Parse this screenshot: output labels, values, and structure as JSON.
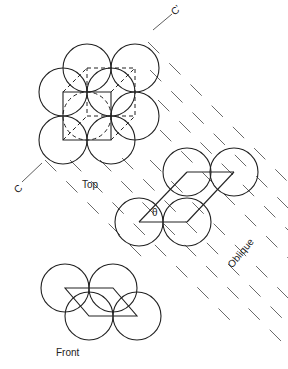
{
  "labels": {
    "top": "Top",
    "oblique": "Oblique",
    "front": "Front",
    "theta": "θ",
    "c": "C",
    "c_prime": "C'"
  },
  "radius": 24,
  "top_view": {
    "solid_circles": [
      [
        63,
        92
      ],
      [
        111,
        92
      ],
      [
        63,
        140
      ],
      [
        111,
        140
      ],
      [
        87,
        68
      ],
      [
        135,
        68
      ],
      [
        135,
        116
      ]
    ],
    "dashed_circles": [
      [
        87,
        116
      ]
    ],
    "solid_square": [
      [
        63,
        92
      ],
      [
        111,
        92
      ],
      [
        111,
        140
      ],
      [
        63,
        140
      ]
    ],
    "dashed_square": [
      [
        87,
        68
      ],
      [
        135,
        68
      ],
      [
        135,
        116
      ],
      [
        87,
        116
      ]
    ],
    "diagonals_dashed": [
      [
        [
          63,
          92
        ],
        [
          87,
          68
        ]
      ],
      [
        [
          111,
          92
        ],
        [
          135,
          68
        ]
      ],
      [
        [
          111,
          140
        ],
        [
          135,
          116
        ]
      ],
      [
        [
          63,
          140
        ],
        [
          87,
          116
        ]
      ]
    ]
  },
  "oblique_view": {
    "circles": [
      [
        187,
        172
      ],
      [
        234,
        172
      ],
      [
        139,
        222
      ],
      [
        187,
        222
      ]
    ],
    "edges": [
      [
        [
          139,
          222
        ],
        [
          187,
          222
        ]
      ],
      [
        [
          139,
          222
        ],
        [
          187,
          172
        ]
      ],
      [
        [
          187,
          222
        ],
        [
          234,
          172
        ]
      ],
      [
        [
          187,
          172
        ],
        [
          234,
          172
        ]
      ]
    ]
  },
  "front_view": {
    "solid_circles": [
      [
        65,
        288
      ],
      [
        113,
        288
      ],
      [
        89,
        316
      ],
      [
        137,
        316
      ]
    ],
    "parallelogram": [
      [
        65,
        288
      ],
      [
        113,
        288
      ],
      [
        137,
        316
      ],
      [
        89,
        316
      ]
    ]
  },
  "axis_line": {
    "segments": [
      [
        [
          22,
          182
        ],
        [
          42,
          163
        ]
      ],
      [
        [
          153,
          30
        ],
        [
          172,
          14
        ]
      ]
    ]
  },
  "projection_lines": [
    [
      [
        100,
        160
      ],
      [
        300,
        360
      ]
    ],
    [
      [
        122,
        158
      ],
      [
        300,
        336
      ]
    ],
    [
      [
        150,
        160
      ],
      [
        300,
        310
      ]
    ],
    [
      [
        160,
        130
      ],
      [
        300,
        270
      ]
    ],
    [
      [
        158,
        100
      ],
      [
        300,
        242
      ]
    ],
    [
      [
        150,
        70
      ],
      [
        300,
        220
      ]
    ],
    [
      [
        70,
        160
      ],
      [
        230,
        320
      ]
    ],
    [
      [
        45,
        160
      ],
      [
        150,
        265
      ]
    ],
    [
      [
        148,
        42
      ],
      [
        300,
        194
      ]
    ]
  ]
}
